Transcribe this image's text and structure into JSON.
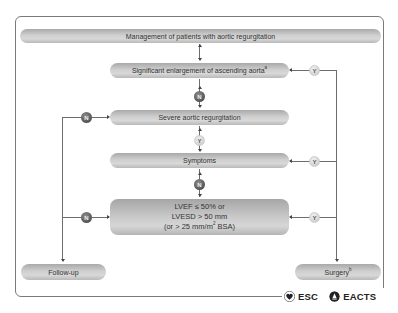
{
  "diagram": {
    "title": "Management of patients with aortic regurgitation",
    "nodes": {
      "enlargement": {
        "label": "Significant enlargement of ascending aorta",
        "superscript": "a"
      },
      "severe_ar": {
        "label": "Severe aortic regurgitation"
      },
      "symptoms": {
        "label": "Symptoms"
      },
      "lv": {
        "line1": "LVEF ≤ 50% or",
        "line2": "LVESD > 50 mm",
        "line3_pre": "(or > 25 mm/m",
        "line3_sup": "2",
        "line3_post": " BSA)"
      },
      "follow_up": {
        "label": "Follow-up"
      },
      "surgery": {
        "label": "Surgery",
        "superscript": "b"
      }
    },
    "decisions": {
      "yes": "Y",
      "no": "N"
    },
    "edges": [
      {
        "from": "title",
        "to": "enlargement"
      },
      {
        "from": "enlargement",
        "to": "severe_ar",
        "label": "N"
      },
      {
        "from": "enlargement",
        "to": "surgery",
        "label": "Y"
      },
      {
        "from": "severe_ar",
        "to": "symptoms",
        "label": "Y"
      },
      {
        "from": "severe_ar",
        "to": "follow_up",
        "label": "N"
      },
      {
        "from": "symptoms",
        "to": "surgery",
        "label": "Y"
      },
      {
        "from": "symptoms",
        "to": "lv",
        "label": "N"
      },
      {
        "from": "lv",
        "to": "surgery",
        "label": "Y"
      },
      {
        "from": "lv",
        "to": "follow_up",
        "label": "N"
      }
    ]
  },
  "logos": {
    "esc": "ESC",
    "eacts": "EACTS"
  },
  "colors": {
    "box_fill": "#c8c8c8",
    "line": "#6d6d6d",
    "no_circle": "#4a4a4a",
    "yes_circle": "#e0e0e0"
  }
}
